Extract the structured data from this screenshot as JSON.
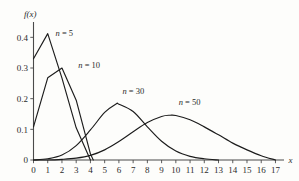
{
  "chart_data": {
    "type": "line",
    "title": "",
    "subtitle": "",
    "xlabel": "x",
    "ylabel": "f(x)",
    "xlim": [
      0,
      17.6
    ],
    "ylim": [
      0,
      0.45
    ],
    "grid": false,
    "legend_position": "inline-annotations",
    "x_ticks": [
      "0",
      "1",
      "2",
      "3",
      "4",
      "5",
      "6",
      "7",
      "8",
      "9",
      "10",
      "11",
      "12",
      "13",
      "14",
      "15",
      "16",
      "17"
    ],
    "x_tick_values": [
      0,
      1,
      2,
      3,
      4,
      5,
      6,
      7,
      8,
      9,
      10,
      11,
      12,
      13,
      14,
      15,
      16,
      17
    ],
    "y_ticks": [
      "0",
      "0.1",
      "0.2",
      "0.3",
      "0.4"
    ],
    "y_tick_values": [
      0,
      0.1,
      0.2,
      0.3,
      0.4
    ],
    "annotations": [
      {
        "text": "n = 5",
        "name": "n-5",
        "x": 1.55,
        "y": 0.405
      },
      {
        "text": "n = 10",
        "name": "n-10",
        "x": 3.15,
        "y": 0.3
      },
      {
        "text": "n = 30",
        "name": "n-30",
        "x": 6.25,
        "y": 0.215
      },
      {
        "text": "n = 50",
        "name": "n-50",
        "x": 10.2,
        "y": 0.178
      }
    ],
    "series": [
      {
        "name": "n = 5",
        "n": 5,
        "x": [
          0,
          1,
          2,
          3,
          4
        ],
        "values": [
          0.33,
          0.412,
          0.267,
          0.105,
          0.0
        ]
      },
      {
        "name": "n = 10",
        "n": 10,
        "x": [
          0,
          1,
          2,
          3,
          4,
          4.2
        ],
        "values": [
          0.108,
          0.268,
          0.3,
          0.195,
          0.02,
          0.0
        ]
      },
      {
        "name": "n = 30",
        "n": 30,
        "x": [
          0,
          1,
          2,
          3,
          4,
          5,
          5.8,
          6,
          7,
          8,
          9,
          10,
          11,
          12,
          13
        ],
        "values": [
          0.0,
          0.004,
          0.016,
          0.047,
          0.098,
          0.155,
          0.183,
          0.182,
          0.158,
          0.108,
          0.061,
          0.029,
          0.012,
          0.004,
          0.0
        ]
      },
      {
        "name": "n = 50",
        "n": 50,
        "x": [
          0,
          1,
          2,
          3,
          4,
          5,
          6,
          7,
          8,
          9,
          9.6,
          10,
          11,
          12,
          13,
          14,
          15,
          16,
          17
        ],
        "values": [
          0.0,
          0.0,
          0.002,
          0.006,
          0.015,
          0.033,
          0.06,
          0.092,
          0.122,
          0.142,
          0.146,
          0.145,
          0.131,
          0.108,
          0.082,
          0.055,
          0.033,
          0.014,
          0.0
        ]
      }
    ]
  },
  "colors": {
    "axis": "#4a4a4a",
    "curve": "#1c1c1c",
    "text": "#2b2b2b",
    "background": "#fdfdfb"
  }
}
